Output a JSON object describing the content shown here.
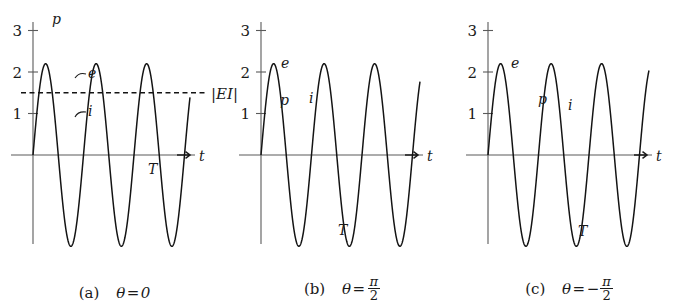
{
  "figure": {
    "axis_label_t": "t",
    "period_label": "T",
    "ei_label": "|EI|",
    "curve_labels": {
      "p": "p",
      "e": "e",
      "i": "i"
    },
    "y_ticks": [
      "1",
      "2",
      "3"
    ]
  },
  "panels": [
    {
      "id": "a",
      "caption_index": "(a)",
      "caption_theta": "θ = 0",
      "theta_text": "0",
      "theta_value_deg": 0,
      "show_ei_line": true,
      "show_T": true,
      "T_label": "T",
      "labels": {
        "p": "p",
        "e": "e",
        "i": "i"
      }
    },
    {
      "id": "b",
      "caption_index": "(b)",
      "caption_theta": "θ = π/2",
      "theta_num": "π",
      "theta_den": "2",
      "theta_sign": "",
      "theta_value_deg": 90,
      "show_ei_line": false,
      "show_T": true,
      "T_label": "T",
      "labels": {
        "p": "p",
        "e": "e",
        "i": "i"
      }
    },
    {
      "id": "c",
      "caption_index": "(c)",
      "caption_theta": "θ = -π/2",
      "theta_num": "π",
      "theta_den": "2",
      "theta_sign": "−",
      "theta_value_deg": -90,
      "show_ei_line": false,
      "show_T": true,
      "T_label": "T",
      "labels": {
        "p": "p",
        "e": "e",
        "i": "i"
      }
    }
  ],
  "chart_data": {
    "type": "line",
    "xlabel": "t",
    "ylabel": "",
    "ylim": [
      -2.6,
      3.3
    ],
    "xlim": [
      0,
      3.0
    ],
    "grid": false,
    "legend": "inline curve labels",
    "y_ticks": [
      1,
      2,
      3
    ],
    "annotations": [
      {
        "text": "|EI|",
        "value": 1.5,
        "kind": "horizontal-dashed-line",
        "panels": [
          "a"
        ]
      },
      {
        "text": "T",
        "kind": "period-marker",
        "panels": [
          "a",
          "b",
          "c"
        ]
      }
    ],
    "amplitudes": {
      "e": 2.2,
      "i": 1.45,
      "p_peak_a": 3.0
    },
    "panels": [
      {
        "id": "a",
        "theta_deg": 0,
        "series": [
          {
            "name": "e",
            "formula": "2.2*sin(2*pi*x)",
            "amplitude": 2.2,
            "phase_deg": 0
          },
          {
            "name": "i",
            "formula": "1.45*sin(2*pi*x)",
            "amplitude": 1.45,
            "phase_deg": 0
          },
          {
            "name": "p",
            "formula": "e*i = 1.595*(1-cos(4*pi*x))",
            "peak": 3.0,
            "min": 0.0
          }
        ],
        "shaded": "area between p and zero axis (all positive)"
      },
      {
        "id": "b",
        "theta_deg": 90,
        "series": [
          {
            "name": "e",
            "formula": "2.2*sin(2*pi*x)",
            "amplitude": 2.2,
            "phase_deg": 0
          },
          {
            "name": "i",
            "formula": "1.45*sin(2*pi*x - pi/2)",
            "amplitude": 1.45,
            "phase_deg": -90
          },
          {
            "name": "p",
            "formula": "e*i = 1.595*sin(4*pi*x)",
            "peak": 1.6,
            "min": -1.6
          }
        ],
        "shaded": "area between p and zero axis (alternating sign)"
      },
      {
        "id": "c",
        "theta_deg": -90,
        "series": [
          {
            "name": "e",
            "formula": "2.2*sin(2*pi*x)",
            "amplitude": 2.2,
            "phase_deg": 0
          },
          {
            "name": "i",
            "formula": "1.45*sin(2*pi*x + pi/2)",
            "amplitude": 1.45,
            "phase_deg": 90
          },
          {
            "name": "p",
            "formula": "e*i = -1.595*sin(4*pi*x)",
            "peak": 1.6,
            "min": -1.6
          }
        ],
        "shaded": "area between p and zero axis (alternating sign)"
      }
    ]
  }
}
